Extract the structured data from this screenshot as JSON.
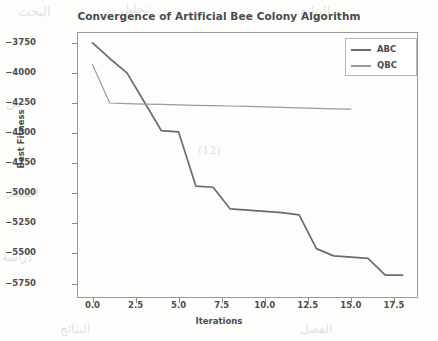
{
  "chart_data": {
    "type": "line",
    "title": "Convergence of Artificial Bee Colony Algorithm",
    "xlabel": "Iterations",
    "ylabel": "Best Fitness",
    "xlim": [
      -0.9,
      18.9
    ],
    "ylim": [
      -5870,
      -3660
    ],
    "grid": false,
    "legend_position": "upper right",
    "xticks": [
      "0.0",
      "2.5",
      "5.0",
      "7.5",
      "10.0",
      "12.5",
      "15.0",
      "17.5"
    ],
    "xtick_values": [
      0.0,
      2.5,
      5.0,
      7.5,
      10.0,
      12.5,
      15.0,
      17.5
    ],
    "yticks": [
      "−3750",
      "−4000",
      "−4250",
      "−4500",
      "−4750",
      "−5000",
      "−5250",
      "−5500",
      "−5750"
    ],
    "ytick_values": [
      -3750,
      -4000,
      -4250,
      -4500,
      -4750,
      -5000,
      -5250,
      -5500,
      -5750
    ],
    "series": [
      {
        "name": "ABC",
        "color": "#6c6c6c",
        "x": [
          0,
          1,
          2,
          3,
          4,
          5,
          6,
          7,
          8,
          9,
          10,
          11,
          12,
          13,
          14,
          15,
          16,
          17,
          18
        ],
        "values": [
          -3750,
          -3880,
          -4000,
          -4240,
          -4480,
          -4490,
          -4940,
          -4950,
          -5130,
          -5140,
          -5150,
          -5160,
          -5180,
          -5460,
          -5520,
          -5530,
          -5540,
          -5680,
          -5680
        ]
      },
      {
        "name": "QBC",
        "color": "#9b9b9b",
        "x": [
          0,
          1,
          2,
          3,
          4,
          5,
          6,
          7,
          8,
          9,
          10,
          11,
          12,
          13,
          14,
          15
        ],
        "values": [
          -3930,
          -4250,
          -4255,
          -4260,
          -4262,
          -4265,
          -4270,
          -4272,
          -4275,
          -4278,
          -4282,
          -4286,
          -4290,
          -4294,
          -4298,
          -4300
        ]
      }
    ]
  },
  "legend": {
    "entries": [
      {
        "label": "ABC"
      },
      {
        "label": "QBC"
      }
    ]
  },
  "background_artifacts": {
    "note": "scanned page bleed-through",
    "fragments": [
      "البحث",
      "تحليل",
      "النتائج",
      "من",
      "الشكل",
      "دراسة",
      "(12)",
      "الفصل"
    ]
  }
}
